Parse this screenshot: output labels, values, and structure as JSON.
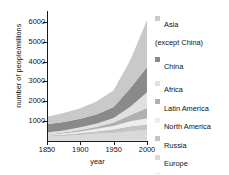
{
  "chart_data": {
    "type": "area",
    "title": "",
    "xlabel": "year",
    "ylabel": "number of people/millions",
    "xlim": [
      1850,
      2000
    ],
    "ylim": [
      0,
      6500
    ],
    "xticks": [
      1850,
      1900,
      1950,
      2000
    ],
    "yticks": [
      1000,
      2000,
      3000,
      4000,
      5000,
      6000
    ],
    "grid": false,
    "legend_position": "right",
    "stacked": true,
    "x": [
      1850,
      1875,
      1900,
      1925,
      1950,
      1975,
      2000
    ],
    "series": [
      {
        "name": "Australasia and Pacific",
        "color": "#e8e8e8",
        "values": [
          2,
          4,
          6,
          10,
          13,
          21,
          30
        ]
      },
      {
        "name": "Europe",
        "color": "#d9d9d9",
        "values": [
          210,
          250,
          295,
          350,
          395,
          475,
          510
        ]
      },
      {
        "name": "Russia",
        "color": "#c4c4c4",
        "values": [
          60,
          75,
          100,
          130,
          180,
          250,
          290
        ]
      },
      {
        "name": "North America",
        "color": "#ededed",
        "values": [
          26,
          48,
          82,
          125,
          172,
          243,
          310
        ]
      },
      {
        "name": "Latin America",
        "color": "#b0b0b0",
        "values": [
          33,
          48,
          74,
          104,
          167,
          322,
          520
        ]
      },
      {
        "name": "Africa",
        "color": "#e0e0e0",
        "values": [
          95,
          110,
          133,
          162,
          229,
          416,
          800
        ]
      },
      {
        "name": "China",
        "color": "#8a8a8a",
        "values": [
          412,
          420,
          430,
          470,
          555,
          930,
          1270
        ]
      },
      {
        "name": "Asia (except China)",
        "color": "#c9c9c9",
        "values": [
          390,
          450,
          530,
          650,
          850,
          1420,
          2350
        ]
      }
    ]
  },
  "axes": {
    "ylabel": "number of people/millions",
    "xlabel": "year",
    "yticklabels": [
      "1000",
      "2000",
      "3000",
      "4000",
      "5000",
      "6000"
    ],
    "xticklabels": [
      "1850",
      "1900",
      "1950",
      "2000"
    ]
  },
  "legend": {
    "items": [
      {
        "label": "Asia\n(except China)",
        "color": "#c9c9c9"
      },
      {
        "label": "China",
        "color": "#8a8a8a"
      },
      {
        "label": "Africa",
        "color": "#e0e0e0"
      },
      {
        "label": "Latin America",
        "color": "#b0b0b0"
      },
      {
        "label": "North America",
        "color": "#ededed"
      },
      {
        "label": "Russia",
        "color": "#c4c4c4"
      },
      {
        "label": "Europe",
        "color": "#d9d9d9"
      },
      {
        "label": "Australasia\nand Pacific",
        "color": "#e8e8e8"
      }
    ]
  }
}
